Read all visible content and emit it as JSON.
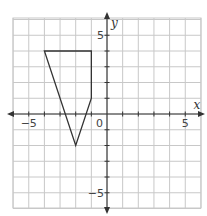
{
  "chart_data": {
    "type": "coordinate-plane",
    "title": "",
    "xlabel": "x",
    "ylabel": "y",
    "xlim": [
      -6,
      6
    ],
    "ylim": [
      -6,
      6
    ],
    "grid": true,
    "grid_step": 1,
    "tick_labels": {
      "x": [
        {
          "value": -5,
          "label": "−5"
        },
        {
          "value": 5,
          "label": "5"
        }
      ],
      "y": [
        {
          "value": 5,
          "label": "5"
        },
        {
          "value": -5,
          "label": "−5"
        }
      ],
      "origin": "0"
    },
    "shapes": [
      {
        "type": "polygon",
        "name": "quadrilateral",
        "vertices": [
          [
            -4,
            4
          ],
          [
            -1,
            4
          ],
          [
            -1,
            1
          ],
          [
            -2,
            -2
          ]
        ]
      }
    ]
  },
  "colors": {
    "grid": "#c8c8c8",
    "axis": "#333333",
    "shape": "#333333",
    "background": "#ffffff"
  }
}
